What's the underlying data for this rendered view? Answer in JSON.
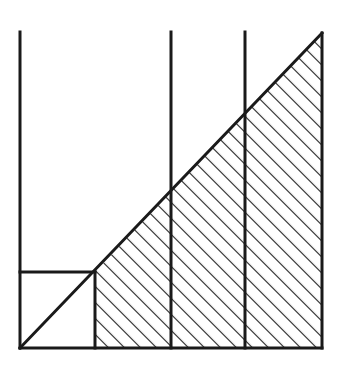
{
  "canvas": {
    "width": 343,
    "height": 371,
    "background_color": "#ffffff",
    "stroke_color": "#1a1a1a",
    "hatch_color": "#1a1a1a"
  },
  "figure": {
    "name": "hatched-right-triangle-with-vertical-partitions",
    "stroke_width": 3,
    "hatch_stroke_width": 2.2,
    "hatch_spacing_px": 16,
    "hatch_angle_deg": 45
  },
  "chart_data": {
    "type": "area",
    "title": "",
    "subtitle": "",
    "xlabel": "",
    "ylabel": "",
    "grid": false,
    "legend": null,
    "axis_ranges": {
      "x": [
        20,
        322
      ],
      "y": [
        348,
        33
      ]
    },
    "geometry": {
      "baseline_y": 348,
      "left_axis_x": 20,
      "right_edge_x": 322,
      "apex": {
        "x": 322,
        "y": 33
      },
      "origin": {
        "x": 20,
        "y": 348
      },
      "top_extent_y": 32
    },
    "hypotenuse": {
      "from": {
        "x": 20,
        "y": 348
      },
      "to": {
        "x": 322,
        "y": 33
      },
      "slope": -1.043
    },
    "partitions": [
      {
        "label": "p0",
        "x": 20,
        "top_y": 32,
        "bottom_y": 348,
        "diagonal_y": 348
      },
      {
        "label": "p1",
        "x": 95,
        "top_y": 272,
        "bottom_y": 348,
        "diagonal_y": 272
      },
      {
        "label": "p2",
        "x": 171,
        "top_y": 32,
        "bottom_y": 348,
        "diagonal_y": 192
      },
      {
        "label": "p3",
        "x": 245,
        "top_y": 32,
        "bottom_y": 348,
        "diagonal_y": 118
      },
      {
        "label": "p4",
        "x": 322,
        "top_y": 33,
        "bottom_y": 348,
        "diagonal_y": 33
      }
    ],
    "inscribed_square": {
      "x0": 20,
      "y0": 272,
      "x1": 95,
      "y1": 348,
      "width": 75,
      "height": 76,
      "filled": false
    },
    "hatched_region": {
      "filled": true,
      "vertices": [
        {
          "x": 95,
          "y": 348
        },
        {
          "x": 322,
          "y": 348
        },
        {
          "x": 322,
          "y": 33
        },
        {
          "x": 95,
          "y": 272
        }
      ]
    },
    "strips": [
      {
        "name": "strip-1",
        "x_from": 95,
        "x_to": 171,
        "hatched": true
      },
      {
        "name": "strip-2",
        "x_from": 171,
        "x_to": 245,
        "hatched": true
      },
      {
        "name": "strip-3",
        "x_from": 245,
        "x_to": 322,
        "hatched": true
      }
    ],
    "annotations": []
  }
}
